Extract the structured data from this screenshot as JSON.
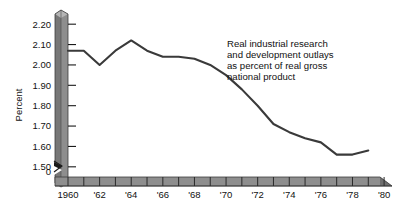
{
  "chart_data": {
    "type": "line",
    "title": "",
    "annotation": [
      "Real industrial research",
      "and development outlays",
      "as percent of real gross",
      "national product"
    ],
    "annotation_full": "Real industrial research and development outlays as percent of real gross national product",
    "xlabel": "",
    "ylabel": "Percent",
    "ylim": [
      1.45,
      2.25
    ],
    "yticks": [
      "1.50",
      "1.60",
      "1.70",
      "1.80",
      "1.90",
      "2.00",
      "2.10",
      "2.20"
    ],
    "ytick_values": [
      1.5,
      1.6,
      1.7,
      1.8,
      1.9,
      2.0,
      2.1,
      2.2
    ],
    "y_origin_label": "0",
    "y_axis_break": true,
    "grid": false,
    "legend": false,
    "xlim": [
      1960,
      1980.5
    ],
    "xticks": [
      1960,
      1961,
      1962,
      1963,
      1964,
      1965,
      1966,
      1967,
      1968,
      1969,
      1970,
      1971,
      1972,
      1973,
      1974,
      1975,
      1976,
      1977,
      1978,
      1979,
      1980
    ],
    "xtick_labels": [
      "1960",
      "",
      "'62",
      "",
      "'64",
      "",
      "'66",
      "",
      "'68",
      "",
      "'70",
      "",
      "'72",
      "",
      "'74",
      "",
      "'76",
      "",
      "'78",
      "",
      "'80"
    ],
    "series": [
      {
        "name": "Real industrial R&D outlays as percent of real GNP",
        "color": "#3a3a3a",
        "x": [
          1960,
          1961,
          1962,
          1963,
          1964,
          1965,
          1966,
          1967,
          1968,
          1969,
          1970,
          1971,
          1972,
          1973,
          1974,
          1975,
          1976,
          1977,
          1978,
          1979
        ],
        "values": [
          2.07,
          2.07,
          2.0,
          2.07,
          2.12,
          2.07,
          2.04,
          2.04,
          2.03,
          2.0,
          1.95,
          1.88,
          1.8,
          1.71,
          1.67,
          1.64,
          1.62,
          1.56,
          1.56,
          1.58
        ]
      }
    ]
  },
  "axes": {
    "y_axis_title": "Percent",
    "origin_label": "0"
  }
}
